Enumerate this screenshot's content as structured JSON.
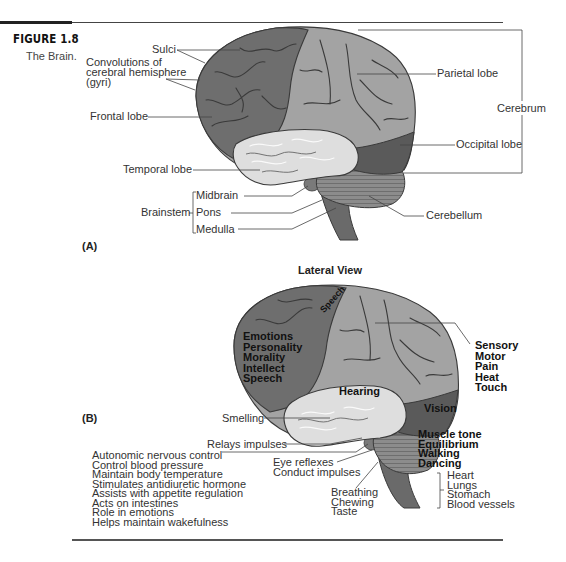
{
  "figure": {
    "number": "FIGURE 1.8",
    "caption": "The Brain."
  },
  "panel_a": {
    "label": "(A)",
    "labels": {
      "sulci": "Sulci",
      "convolutions_line1": "Convolutions of",
      "convolutions_line2": "cerebral hemisphere",
      "convolutions_line3": "(gyri)",
      "frontal_lobe": "Frontal lobe",
      "temporal_lobe": "Temporal lobe",
      "parietal_lobe": "Parietal lobe",
      "occipital_lobe": "Occipital lobe",
      "cerebrum": "Cerebrum",
      "cerebellum": "Cerebellum",
      "brainstem": "Brainstem",
      "midbrain": "Midbrain",
      "pons": "Pons",
      "medulla": "Medulla"
    }
  },
  "panel_b": {
    "label": "(B)",
    "title": "Lateral View",
    "frontal_functions": [
      "Emotions",
      "Personality",
      "Morality",
      "Intellect",
      "Speech"
    ],
    "speech_label": "Speech",
    "parietal_functions": [
      "Sensory",
      "Motor",
      "Pain",
      "Heat",
      "Touch"
    ],
    "hearing": "Hearing",
    "vision": "Vision",
    "smelling": "Smelling",
    "relays_impulses": "Relays impulses",
    "cerebellum_functions": [
      "Muscle tone",
      "Equilibrium",
      "Walking",
      "Dancing"
    ],
    "midbrain_functions": [
      "Eye reflexes",
      "Conduct impulses"
    ],
    "pons_functions": [
      "Breathing",
      "Chewing",
      "Taste"
    ],
    "medulla_functions": [
      "Heart",
      "Lungs",
      "Stomach",
      "Blood vessels"
    ],
    "hypothalamus_functions": [
      "Autonomic nervous control",
      "Control blood pressure",
      "Maintain body temperature",
      "Stimulates antidiuretic hormone",
      "Assists with appetite regulation",
      "Acts on intestines",
      "Role in emotions",
      "Helps maintain wakefulness"
    ]
  },
  "colors": {
    "frontal": "#6e6e6e",
    "parietal": "#a3a3a3",
    "temporal": "#dcdcdc",
    "occipital": "#5a5a5a",
    "cerebellum": "#8a8a8a",
    "brainstem": "#6a6a6a",
    "outline": "#3a3a3a"
  }
}
